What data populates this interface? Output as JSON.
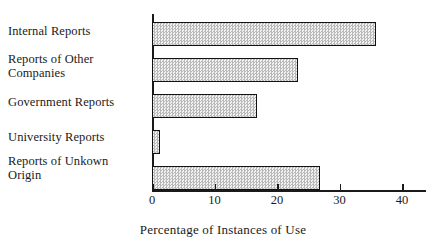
{
  "chart_data": {
    "type": "bar",
    "orientation": "horizontal",
    "title": "",
    "xlabel": "Percentage of Instances of Use",
    "ylabel": "",
    "categories": [
      "Internal Reports",
      "Reports of Other\nCompanies",
      "Government Reports",
      "University Reports",
      "Reports of Unkown\nOrigin"
    ],
    "values": [
      35.8,
      23.4,
      16.8,
      1.3,
      26.8
    ],
    "xlim": [
      0,
      40
    ],
    "ylim": [
      0,
      5
    ],
    "xticks": [
      0,
      10,
      20,
      30,
      40
    ],
    "xticklabels": [
      "0",
      "10",
      "20",
      "30",
      "40"
    ],
    "grid": false,
    "legend": false,
    "bar_fill": "#e3e3e3",
    "bar_edge": "#111111",
    "bar_pattern": "checkerboard-stipple",
    "background": "#ffffff"
  },
  "axis": {
    "title": "Percentage of Instances of Use"
  }
}
